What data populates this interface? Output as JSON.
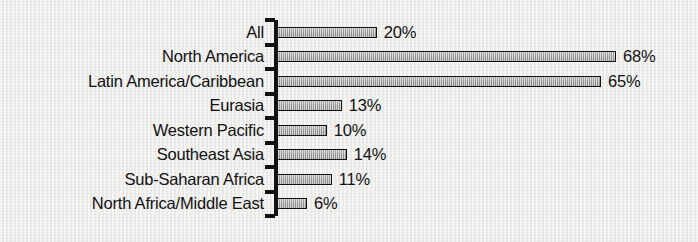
{
  "chart_data": {
    "type": "bar",
    "orientation": "horizontal",
    "title": "",
    "subtitle": "",
    "xlabel": "",
    "ylabel": "",
    "xlim": [
      0,
      68
    ],
    "grid": false,
    "legend": null,
    "value_suffix": "%",
    "categories": [
      "All",
      "North America",
      "Latin America/Caribbean",
      "Eurasia",
      "Western Pacific",
      "Southeast Asia",
      "Sub-Saharan Africa",
      "North Africa/Middle East"
    ],
    "values": [
      20,
      68,
      65,
      13,
      10,
      14,
      11,
      6
    ],
    "data_labels": [
      "20%",
      "68%",
      "65%",
      "13%",
      "10%",
      "14%",
      "11%",
      "6%"
    ],
    "bars": [
      {
        "label": "All",
        "value": 20,
        "data_label": "20%"
      },
      {
        "label": "North America",
        "value": 68,
        "data_label": "68%"
      },
      {
        "label": "Latin America/Caribbean",
        "value": 65,
        "data_label": "65%"
      },
      {
        "label": "Eurasia",
        "value": 13,
        "data_label": "13%"
      },
      {
        "label": "Western Pacific",
        "value": 10,
        "data_label": "10%"
      },
      {
        "label": "Southeast Asia",
        "value": 14,
        "data_label": "14%"
      },
      {
        "label": "Sub-Saharan Africa",
        "value": 11,
        "data_label": "11%"
      },
      {
        "label": "North Africa/Middle East",
        "value": 6,
        "data_label": "6%"
      }
    ],
    "colors": {
      "bar_fill": "#a8a8a8",
      "bar_border": "#101010",
      "axis": "#121212",
      "text": "#111111",
      "background": "#efefed"
    }
  }
}
